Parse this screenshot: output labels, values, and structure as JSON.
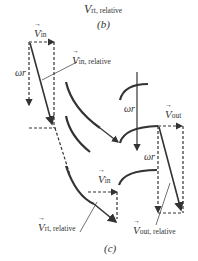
{
  "top_caption": {
    "vector_symbol": "V",
    "subscript": "rt, relative",
    "panel_label": "(b)"
  },
  "figure": {
    "panel_label": "(c)",
    "labels": {
      "v_in_top": {
        "symbol": "V",
        "subscript": "in"
      },
      "v_in_relative": {
        "symbol": "V",
        "subscript": "in, relative"
      },
      "omega_r_left": "ωr",
      "omega_r_mid": "ωr",
      "omega_r_right": "ωr",
      "v_out": {
        "symbol": "V",
        "subscript": "out"
      },
      "v_in_bottom": {
        "symbol": "V",
        "subscript": "in"
      },
      "v_rt_relative": {
        "symbol": "V",
        "subscript": "rt, relative"
      },
      "v_out_relative": {
        "symbol": "V",
        "subscript": "out, relative"
      }
    },
    "colors": {
      "stroke": "#333333",
      "background": "#ffffff"
    }
  }
}
